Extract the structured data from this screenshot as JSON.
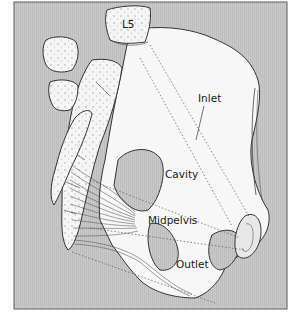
{
  "figure": {
    "background_color": "#c8c8c8",
    "bone_color": "#f4f4f4",
    "outline_color": "#3a3a3a",
    "labels": {
      "vertebra": "L5",
      "inlet": "Inlet",
      "cavity": "Cavity",
      "midpelvis": "Midpelvis",
      "outlet": "Outlet"
    }
  }
}
